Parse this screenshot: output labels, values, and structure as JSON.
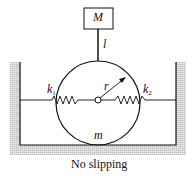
{
  "diagram": {
    "type": "mechanical-system",
    "labels": {
      "mass_block": "M",
      "rod_length": "l",
      "radius": "r",
      "disk_mass": "m",
      "spring_left": {
        "base": "k",
        "sub": "1"
      },
      "spring_right": {
        "base": "k",
        "sub": "2"
      },
      "caption": "No slipping"
    },
    "colors": {
      "line": "#111111",
      "hatch": "#c8c8c8",
      "background": "#ffffff"
    }
  }
}
